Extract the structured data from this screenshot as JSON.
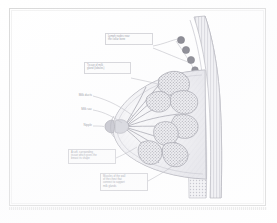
{
  "figure": {
    "view": "sagittal section of the female breast and chest wall",
    "style": "light grayscale scanned medical illustration",
    "background_color": "#ffffff",
    "frame_color": "#d9d9d9",
    "ink_color": "#9a9aa2",
    "label_text_color": "#8c8f9a",
    "callout_border_color": "#cfcfd4"
  },
  "callouts": {
    "lymph_nodes": {
      "lines": [
        "Lymph nodes near",
        "the collar bone"
      ],
      "target": "lymph-nodes"
    },
    "lobules": {
      "lines": [
        "Tissue of milk",
        "gland (lobules)"
      ],
      "target": "glandular-lobules"
    },
    "fatty_tissue": {
      "lines": [
        "A soft, surrounding",
        "tissue which gives the",
        "breast its shape"
      ],
      "target": "fatty-tissue"
    },
    "muscle": {
      "lines": [
        "Muscles of the wall",
        "of the chest that",
        "connect to support",
        "milk glands"
      ],
      "target": "chest-wall-muscle"
    }
  },
  "side_labels": {
    "milk_ducts": "Milk ducts",
    "milk_sinus": "Milk sac",
    "nipple": "Nipple"
  },
  "anatomy": {
    "lymph_node_count": 4,
    "lobule_cluster_count": 7,
    "duct_count": 9,
    "parts": [
      "nipple",
      "milk ducts",
      "milk sac (lactiferous sinus)",
      "glandular lobules",
      "fatty tissue",
      "chest wall muscle",
      "ribs",
      "lymph nodes"
    ]
  }
}
